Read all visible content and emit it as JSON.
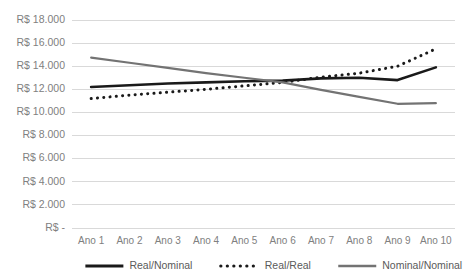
{
  "chart_data": {
    "type": "line",
    "title": "",
    "xlabel": "",
    "ylabel": "",
    "grid": true,
    "legend_position": "bottom",
    "currency_prefix": "R$",
    "categories": [
      "Ano 1",
      "Ano 2",
      "Ano 3",
      "Ano 4",
      "Ano 5",
      "Ano 6",
      "Ano 7",
      "Ano 8",
      "Ano 9",
      "Ano 10"
    ],
    "ylim": [
      0,
      18000
    ],
    "ytick_values": [
      0,
      2000,
      4000,
      6000,
      8000,
      10000,
      12000,
      14000,
      16000,
      18000
    ],
    "ytick_labels": [
      "R$ -",
      "R$ 2.000",
      "R$ 4.000",
      "R$ 6.000",
      "R$ 8.000",
      "R$ 10.000",
      "R$ 12.000",
      "R$ 14.000",
      "R$ 16.000",
      "R$ 18.000"
    ],
    "series": [
      {
        "name": "Real/Nominal",
        "style": "solid",
        "color": "#1a1a1a",
        "width": 2.6,
        "values": [
          12200,
          12350,
          12500,
          12600,
          12700,
          12750,
          12950,
          13000,
          12800,
          13900
        ]
      },
      {
        "name": "Real/Real",
        "style": "dotted",
        "color": "#1a1a1a",
        "width": 3.0,
        "values": [
          11200,
          11500,
          11750,
          12000,
          12300,
          12600,
          13050,
          13400,
          14000,
          15500
        ]
      },
      {
        "name": "Nominal/Nominal",
        "style": "solid",
        "color": "#737373",
        "width": 2.2,
        "values": [
          14750,
          14300,
          13850,
          13400,
          13000,
          12600,
          11950,
          11350,
          10750,
          10800
        ]
      }
    ]
  },
  "legend": {
    "items": [
      {
        "label": "Real/Nominal",
        "marker": "solid-line-marker"
      },
      {
        "label": "Real/Real",
        "marker": "dotted-line-marker"
      },
      {
        "label": "Nominal/Nominal",
        "marker": "solid-line-marker"
      }
    ]
  }
}
